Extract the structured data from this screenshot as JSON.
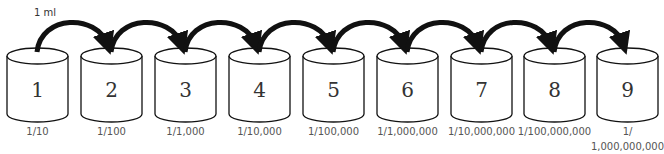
{
  "diagram": {
    "transfer_volume": "1 ml",
    "tubes": [
      {
        "number": "1",
        "dilution": "1/10"
      },
      {
        "number": "2",
        "dilution": "1/100"
      },
      {
        "number": "3",
        "dilution": "1/1,000"
      },
      {
        "number": "4",
        "dilution": "1/10,000"
      },
      {
        "number": "5",
        "dilution": "1/100,000"
      },
      {
        "number": "6",
        "dilution": "1/1,000,000"
      },
      {
        "number": "7",
        "dilution": "1/10,000,000"
      },
      {
        "number": "8",
        "dilution": "1/100,000,000"
      },
      {
        "number": "9",
        "dilution_line1": "1/",
        "dilution_line2": "1,000,000,000"
      }
    ]
  }
}
